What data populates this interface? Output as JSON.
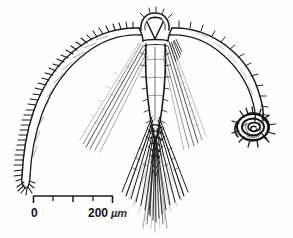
{
  "figure": {
    "domain": "scientific-illustration",
    "background_color": "#fefefe",
    "ink_color": "#1a1a1a",
    "width": 293,
    "height": 238
  },
  "scale_bar": {
    "name": "scale-bar",
    "zero_label": "0",
    "max_label": "200",
    "unit_label": "µm",
    "full_text": "0    200 µm",
    "ticks": 5,
    "segments": 4,
    "bar_left_px": 33,
    "bar_right_px": 113,
    "bar_y_px": 196,
    "length_px": 80,
    "represents_microns": 200
  },
  "anatomy": {
    "head": {
      "name": "head-apex",
      "description": "rounded apex with V-shaped internal structure"
    },
    "left_arm": {
      "name": "left-lateral-arm",
      "description": "long curved double-walled rod with dense barbed spines along outer margin",
      "spine_count": 42
    },
    "right_arm": {
      "name": "right-lateral-arm",
      "description": "long curved double-walled rod with sparse short barbs, terminating in a dark coiled spiral",
      "spine_count": 16
    },
    "spiral": {
      "name": "terminal-spiral-coil",
      "description": "dark spiny coiled terminal structure at right arm tip"
    },
    "body": {
      "name": "central-body-axis",
      "description": "narrow elongate central trunk descending from head"
    },
    "setae": {
      "name": "setal-bundle",
      "description": "dense fan of long fine bristles radiating downward from body terminus"
    },
    "lateral_setae_left": {
      "name": "left-lateral-setae",
      "description": "faint diagonal bristles fanning down-left"
    },
    "lateral_setae_right": {
      "name": "right-lateral-setae",
      "description": "faint diagonal bristles fanning down-right"
    }
  }
}
